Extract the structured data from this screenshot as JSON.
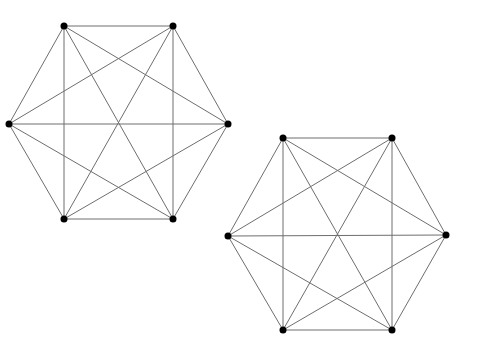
{
  "diagram": {
    "type": "complete-graph",
    "graphs": [
      {
        "name": "K6-left",
        "vertices": [
          {
            "id": "a",
            "x": 64,
            "y": 26
          },
          {
            "id": "b",
            "x": 173,
            "y": 26
          },
          {
            "id": "c",
            "x": 228,
            "y": 124
          },
          {
            "id": "d",
            "x": 173,
            "y": 219
          },
          {
            "id": "e",
            "x": 64,
            "y": 219
          },
          {
            "id": "f",
            "x": 9,
            "y": 124
          }
        ]
      },
      {
        "name": "K6-right",
        "vertices": [
          {
            "id": "a",
            "x": 283,
            "y": 138
          },
          {
            "id": "b",
            "x": 392,
            "y": 138
          },
          {
            "id": "c",
            "x": 446,
            "y": 235
          },
          {
            "id": "d",
            "x": 392,
            "y": 330
          },
          {
            "id": "e",
            "x": 283,
            "y": 330
          },
          {
            "id": "f",
            "x": 228,
            "y": 236
          }
        ]
      }
    ],
    "edge_rule": "all-pairs",
    "colors": {
      "edge": "#6e6e6e",
      "vertex": "#000000",
      "background": "#ffffff"
    },
    "vertex_radius": 3.5
  }
}
